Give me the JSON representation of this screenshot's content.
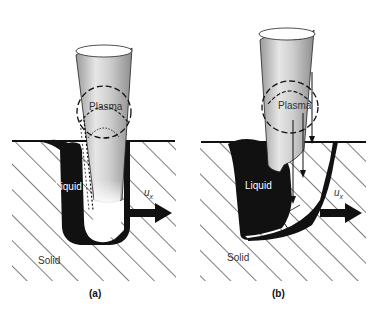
{
  "panels": [
    {
      "id": "a",
      "caption": "(a)",
      "labels": {
        "plasma": "Plasma",
        "liquid": "Liquid",
        "solid": "Solid",
        "velocity": "u",
        "velocity_sub": "x"
      }
    },
    {
      "id": "b",
      "caption": "(b)",
      "labels": {
        "plasma": "Plasma",
        "liquid": "Liquid",
        "solid": "Solid",
        "velocity": "u",
        "velocity_sub": "x"
      }
    }
  ],
  "colors": {
    "background": "#ffffff",
    "ink": "#111111",
    "label_white": "#ffffff",
    "label_gray": "#333333"
  }
}
